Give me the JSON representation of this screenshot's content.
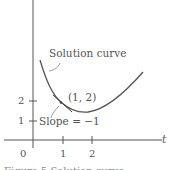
{
  "figure": {
    "labels": {
      "curve": "Solution curve",
      "point": "(1, 2)",
      "slope": "Slope = −1",
      "t_axis": "t"
    },
    "ticks": {
      "origin": "0",
      "x": [
        "1",
        "2"
      ],
      "y": [
        "1",
        "2"
      ]
    },
    "caption": "Figure 5   Solution curve..."
  },
  "colors": {
    "curve": "#555555",
    "axes": "#555555",
    "tangent": "#444444"
  }
}
